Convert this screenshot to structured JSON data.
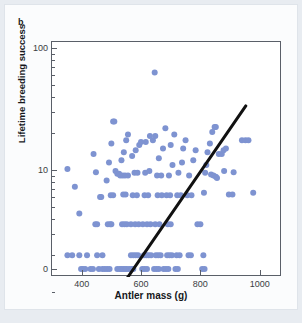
{
  "panel": {
    "label": "b"
  },
  "colors": {
    "point": "#7e93d1",
    "trendline": "#111111",
    "axis": "#5a5f68",
    "card": "#fbfcfd",
    "page": "#e8ecf1"
  },
  "chart_data": {
    "type": "scatter",
    "title": "",
    "xlabel": "Antler mass (g)",
    "ylabel": "Lifetime breeding success",
    "xlim": [
      300,
      1075
    ],
    "ylim": [
      0,
      100
    ],
    "yscale": "log-like (0 at baseline, 10 mid, 100 top)",
    "grid": false,
    "legend": null,
    "xticks": [
      400,
      600,
      800,
      1000
    ],
    "xticklabels": [
      "400",
      "600",
      "800",
      "1000"
    ],
    "yticks": [
      0,
      10,
      100
    ],
    "yticklabels": [
      "0",
      "10",
      "100"
    ],
    "y_minor_ticks": [
      1,
      2,
      3,
      4,
      5,
      6,
      7,
      8,
      9,
      20,
      30,
      40,
      50,
      60,
      70,
      80,
      90
    ],
    "annotations": [
      {
        "text": "b",
        "position": "top-left panel label"
      }
    ],
    "trendline": {
      "type": "linear-fit-on-log-axis",
      "x_start": 392,
      "y_start": 0.35,
      "x_end": 953,
      "y_end": 33.5,
      "color": "#111111",
      "width_px": 3
    },
    "points": [
      [
        352,
        10.2
      ],
      [
        377,
        7.3
      ],
      [
        392,
        4.4
      ],
      [
        352,
        2.0
      ],
      [
        368,
        2.0
      ],
      [
        392,
        2.0
      ],
      [
        404,
        0.0
      ],
      [
        412,
        0.0
      ],
      [
        398,
        0.0
      ],
      [
        418,
        2.0
      ],
      [
        430,
        0.0
      ],
      [
        438,
        0.0
      ],
      [
        446,
        3.6
      ],
      [
        452,
        3.6
      ],
      [
        440,
        13.5
      ],
      [
        448,
        9.6
      ],
      [
        462,
        6.0
      ],
      [
        466,
        6.0
      ],
      [
        452,
        2.0
      ],
      [
        470,
        2.0
      ],
      [
        458,
        0.0
      ],
      [
        470,
        0.0
      ],
      [
        478,
        0.0
      ],
      [
        486,
        0.0
      ],
      [
        494,
        0.0
      ],
      [
        488,
        3.6
      ],
      [
        496,
        3.6
      ],
      [
        500,
        3.6
      ],
      [
        484,
        8.2
      ],
      [
        492,
        11.5
      ],
      [
        500,
        16.5
      ],
      [
        506,
        25.0
      ],
      [
        510,
        25.0
      ],
      [
        498,
        6.2
      ],
      [
        506,
        6.2
      ],
      [
        514,
        9.8
      ],
      [
        520,
        9.3
      ],
      [
        526,
        9.3
      ],
      [
        520,
        0.0
      ],
      [
        528,
        0.0
      ],
      [
        534,
        0.0
      ],
      [
        540,
        0.0
      ],
      [
        546,
        0.0
      ],
      [
        552,
        0.0
      ],
      [
        536,
        3.6
      ],
      [
        544,
        3.6
      ],
      [
        552,
        3.6
      ],
      [
        540,
        6.3
      ],
      [
        548,
        6.3
      ],
      [
        534,
        12.0
      ],
      [
        542,
        14.0
      ],
      [
        550,
        17.5
      ],
      [
        556,
        19.5
      ],
      [
        530,
        9.0
      ],
      [
        538,
        9.0
      ],
      [
        546,
        9.0
      ],
      [
        556,
        9.0
      ],
      [
        560,
        0.0
      ],
      [
        568,
        0.0
      ],
      [
        574,
        0.0
      ],
      [
        566,
        2.0
      ],
      [
        574,
        2.0
      ],
      [
        582,
        2.0
      ],
      [
        590,
        2.0
      ],
      [
        566,
        3.6
      ],
      [
        580,
        3.6
      ],
      [
        592,
        3.6
      ],
      [
        572,
        6.2
      ],
      [
        586,
        6.2
      ],
      [
        578,
        9.5
      ],
      [
        588,
        9.5
      ],
      [
        570,
        13.0
      ],
      [
        582,
        14.5
      ],
      [
        594,
        16.0
      ],
      [
        600,
        17.0
      ],
      [
        604,
        0.0
      ],
      [
        612,
        0.0
      ],
      [
        620,
        0.0
      ],
      [
        610,
        2.0
      ],
      [
        618,
        2.0
      ],
      [
        626,
        2.0
      ],
      [
        634,
        2.0
      ],
      [
        606,
        3.6
      ],
      [
        620,
        3.6
      ],
      [
        632,
        3.6
      ],
      [
        612,
        6.2
      ],
      [
        624,
        6.2
      ],
      [
        614,
        9.5
      ],
      [
        628,
        9.8
      ],
      [
        616,
        17.0
      ],
      [
        630,
        19.0
      ],
      [
        640,
        17.5
      ],
      [
        648,
        19.0
      ],
      [
        646,
        63.0
      ],
      [
        644,
        0.0
      ],
      [
        652,
        0.0
      ],
      [
        660,
        0.0
      ],
      [
        650,
        2.0
      ],
      [
        658,
        2.0
      ],
      [
        666,
        2.0
      ],
      [
        648,
        3.6
      ],
      [
        662,
        3.6
      ],
      [
        656,
        6.2
      ],
      [
        670,
        6.2
      ],
      [
        654,
        9.0
      ],
      [
        668,
        9.0
      ],
      [
        660,
        12.5
      ],
      [
        674,
        15.0
      ],
      [
        682,
        22.0
      ],
      [
        676,
        0.0
      ],
      [
        684,
        0.0
      ],
      [
        692,
        0.0
      ],
      [
        688,
        2.0
      ],
      [
        696,
        2.0
      ],
      [
        704,
        2.0
      ],
      [
        690,
        3.6
      ],
      [
        700,
        3.6
      ],
      [
        686,
        6.2
      ],
      [
        698,
        6.2
      ],
      [
        694,
        9.0
      ],
      [
        706,
        11.0
      ],
      [
        700,
        16.0
      ],
      [
        712,
        19.5
      ],
      [
        716,
        0.0
      ],
      [
        724,
        0.0
      ],
      [
        720,
        2.0
      ],
      [
        730,
        2.0
      ],
      [
        722,
        6.2
      ],
      [
        734,
        6.2
      ],
      [
        726,
        9.5
      ],
      [
        738,
        11.5
      ],
      [
        742,
        15.0
      ],
      [
        750,
        17.5
      ],
      [
        760,
        2.0
      ],
      [
        768,
        2.0
      ],
      [
        756,
        6.2
      ],
      [
        770,
        6.2
      ],
      [
        762,
        9.0
      ],
      [
        776,
        12.0
      ],
      [
        784,
        14.5
      ],
      [
        790,
        3.6
      ],
      [
        800,
        3.6
      ],
      [
        806,
        0.0
      ],
      [
        814,
        0.0
      ],
      [
        810,
        2.0
      ],
      [
        812,
        6.5
      ],
      [
        816,
        9.5
      ],
      [
        820,
        11.0
      ],
      [
        824,
        14.0
      ],
      [
        832,
        16.5
      ],
      [
        840,
        20.5
      ],
      [
        848,
        22.5
      ],
      [
        852,
        22.5
      ],
      [
        836,
        9.2
      ],
      [
        844,
        9.0
      ],
      [
        852,
        8.8
      ],
      [
        856,
        8.6
      ],
      [
        862,
        13.5
      ],
      [
        872,
        13.5
      ],
      [
        878,
        14.5
      ],
      [
        886,
        15.0
      ],
      [
        880,
        9.8
      ],
      [
        896,
        6.3
      ],
      [
        908,
        6.3
      ],
      [
        912,
        9.6
      ],
      [
        940,
        17.5
      ],
      [
        952,
        17.5
      ],
      [
        962,
        17.5
      ],
      [
        978,
        6.5
      ]
    ]
  }
}
